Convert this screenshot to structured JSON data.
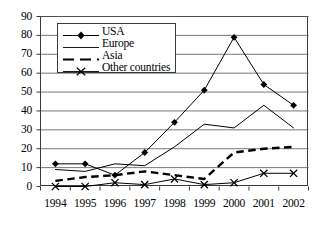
{
  "chart_data": {
    "type": "line",
    "title": "",
    "xlabel": "",
    "ylabel": "",
    "categories": [
      "1994",
      "1995",
      "1996",
      "1997",
      "1998",
      "1999",
      "2000",
      "2001",
      "2002"
    ],
    "x": [
      1994,
      1995,
      1996,
      1997,
      1998,
      1999,
      2000,
      2001,
      2002
    ],
    "ylim": [
      0,
      90
    ],
    "ytick_step": 10,
    "yticks": [
      0,
      10,
      20,
      30,
      40,
      50,
      60,
      70,
      80,
      90
    ],
    "grid": "horizontal",
    "legend_position": "upper-left-inside",
    "series": [
      {
        "name": "USA",
        "marker": "diamond",
        "line_style": "solid",
        "color": "#000000",
        "values": [
          12,
          12,
          6,
          18,
          34,
          51,
          79,
          54,
          43
        ]
      },
      {
        "name": "Europe",
        "marker": "none",
        "line_style": "solid",
        "color": "#000000",
        "values": [
          9,
          8,
          12,
          11,
          21,
          33,
          31,
          43,
          31
        ]
      },
      {
        "name": "Asia",
        "marker": "none",
        "line_style": "dashed",
        "color": "#000000",
        "values": [
          3,
          5,
          6,
          8,
          6,
          4,
          18,
          20,
          21
        ]
      },
      {
        "name": "Other countries",
        "marker": "x",
        "line_style": "solid",
        "color": "#000000",
        "values": [
          0,
          0,
          2,
          1,
          4,
          1,
          2,
          7,
          7
        ]
      }
    ]
  },
  "legend": {
    "items": [
      {
        "label": "USA"
      },
      {
        "label": "Europe"
      },
      {
        "label": "Asia"
      },
      {
        "label": "Other countries"
      }
    ]
  },
  "axes": {
    "y_labels": [
      "90",
      "80",
      "70",
      "60",
      "50",
      "40",
      "30",
      "20",
      "10",
      "0"
    ],
    "x_labels": [
      "1994",
      "1995",
      "1996",
      "1997",
      "1998",
      "1999",
      "2000",
      "2001",
      "2002"
    ]
  }
}
